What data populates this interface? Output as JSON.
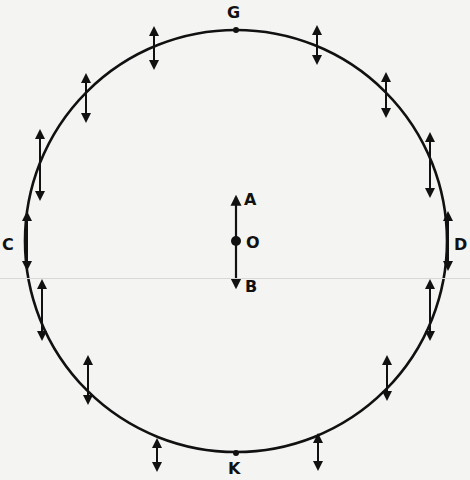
{
  "diagram": {
    "type": "polarization-field-circle",
    "circle": {
      "cx": 236,
      "cy": 241,
      "r": 211,
      "stroke": "#111111"
    },
    "points": {
      "G": {
        "label": "G",
        "x": 236,
        "y": 30,
        "label_x": 227,
        "label_y": 18
      },
      "K": {
        "label": "K",
        "x": 236,
        "y": 453,
        "label_x": 228,
        "label_y": 474
      },
      "C": {
        "label": "C",
        "label_x": 2,
        "label_y": 250
      },
      "D": {
        "label": "D",
        "label_x": 454,
        "label_y": 250
      },
      "O": {
        "label": "O",
        "x": 236,
        "y": 241,
        "label_x": 246,
        "label_y": 248
      },
      "A": {
        "label": "A",
        "label_x": 244,
        "label_y": 205
      },
      "B": {
        "label": "B",
        "label_x": 245,
        "label_y": 292
      }
    },
    "center_arrow": {
      "x": 236,
      "y_top": 197,
      "y_bottom": 287
    },
    "boundary_arrows": [
      {
        "x": 154,
        "y": 48,
        "len": 40
      },
      {
        "x": 317,
        "y": 45,
        "len": 36
      },
      {
        "x": 86,
        "y": 98,
        "len": 46
      },
      {
        "x": 386,
        "y": 95,
        "len": 42
      },
      {
        "x": 40,
        "y": 165,
        "len": 68
      },
      {
        "x": 430,
        "y": 165,
        "len": 62
      },
      {
        "x": 27,
        "y": 241,
        "len": 56
      },
      {
        "x": 448,
        "y": 241,
        "len": 56
      },
      {
        "x": 42,
        "y": 310,
        "len": 58
      },
      {
        "x": 430,
        "y": 310,
        "len": 58
      },
      {
        "x": 88,
        "y": 380,
        "len": 46
      },
      {
        "x": 387,
        "y": 378,
        "len": 42
      },
      {
        "x": 157,
        "y": 455,
        "len": 30
      },
      {
        "x": 318,
        "y": 452,
        "len": 34
      }
    ]
  }
}
